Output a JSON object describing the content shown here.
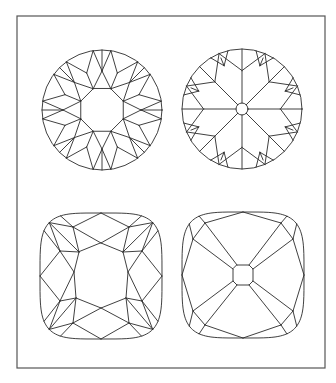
{
  "figure": {
    "frame": {
      "x": 17,
      "y": 16,
      "width": 308,
      "height": 352,
      "stroke": "#555555"
    },
    "line_color": "#2a2a2a",
    "stones": [
      {
        "id": "round-old-european",
        "shape": "round",
        "cx": 102,
        "cy": 110,
        "r": 60,
        "table": "octagon",
        "culet": false
      },
      {
        "id": "round-star-culet",
        "shape": "round",
        "cx": 242,
        "cy": 109,
        "r": 60,
        "table": "none",
        "culet": true,
        "culet_r": 6
      },
      {
        "id": "cushion-open-table",
        "shape": "cushion",
        "cx": 101,
        "cy": 276,
        "half_w": 61,
        "half_h": 63,
        "table": "octagon",
        "culet": false
      },
      {
        "id": "cushion-octagon-culet",
        "shape": "cushion",
        "cx": 243,
        "cy": 275,
        "half_w": 61,
        "half_h": 63,
        "table": "none",
        "culet": true,
        "culet_half": 10
      }
    ]
  }
}
